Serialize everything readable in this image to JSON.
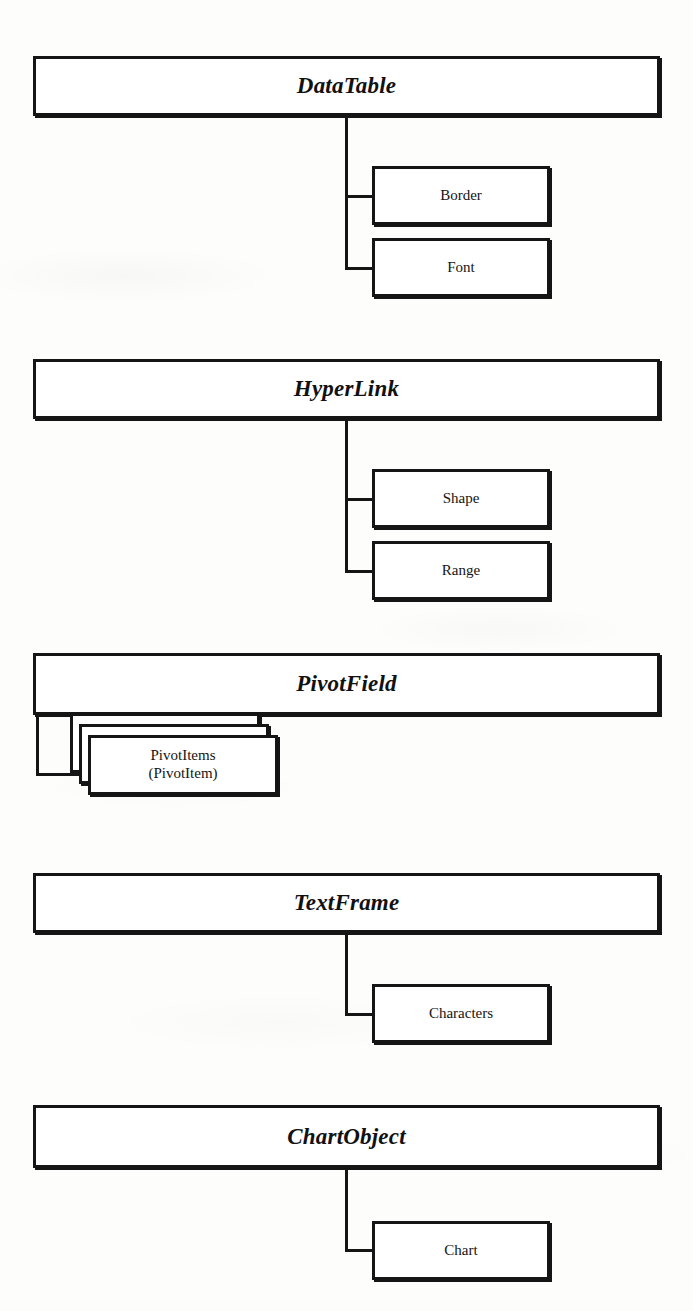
{
  "diagram": {
    "type": "hierarchy",
    "background_color": "#fdfdfb",
    "line_color": "#151515",
    "box_fill_color": "#ffffff",
    "groups": [
      {
        "id": "datatable",
        "parent": "DataTable",
        "parent_box": {
          "x": 33,
          "y": 56,
          "w": 627,
          "h": 60
        },
        "connector": {
          "x": 345,
          "top": 116,
          "bottom": 270
        },
        "children": [
          {
            "label": "Border",
            "collection": false,
            "box": {
              "x": 372,
              "y": 166,
              "w": 178,
              "h": 59
            },
            "stub_y": 195
          },
          {
            "label": "Font",
            "collection": false,
            "box": {
              "x": 372,
              "y": 238,
              "w": 178,
              "h": 59
            },
            "stub_y": 267
          }
        ]
      },
      {
        "id": "hyperlink",
        "parent": "HyperLink",
        "parent_box": {
          "x": 33,
          "y": 359,
          "w": 627,
          "h": 60
        },
        "connector": {
          "x": 345,
          "top": 419,
          "bottom": 572
        },
        "children": [
          {
            "label": "Shape",
            "collection": false,
            "box": {
              "x": 372,
              "y": 469,
              "w": 178,
              "h": 59
            },
            "stub_y": 498
          },
          {
            "label": "Range",
            "collection": false,
            "box": {
              "x": 372,
              "y": 541,
              "w": 178,
              "h": 59
            },
            "stub_y": 570
          }
        ]
      },
      {
        "id": "pivotfield",
        "parent": "PivotField",
        "parent_box": {
          "x": 33,
          "y": 653,
          "w": 627,
          "h": 62
        },
        "connector": {
          "x": 36,
          "top": 715,
          "bottom": 775
        },
        "children": [
          {
            "label": "PivotItems\n(PivotItem)",
            "collection": true,
            "box": {
              "x": 88,
              "y": 735,
              "w": 190,
              "h": 60
            },
            "stub_y": 773,
            "stack_offsets": [
              {
                "dx": -18,
                "dy": -22
              },
              {
                "dx": -9,
                "dy": -11
              }
            ]
          }
        ]
      },
      {
        "id": "textframe",
        "parent": "TextFrame",
        "parent_box": {
          "x": 33,
          "y": 873,
          "w": 627,
          "h": 60
        },
        "connector": {
          "x": 345,
          "top": 933,
          "bottom": 1015
        },
        "children": [
          {
            "label": "Characters",
            "collection": false,
            "box": {
              "x": 372,
              "y": 984,
              "w": 178,
              "h": 59
            },
            "stub_y": 1013
          }
        ]
      },
      {
        "id": "chartobject",
        "parent": "ChartObject",
        "parent_box": {
          "x": 33,
          "y": 1105,
          "w": 627,
          "h": 63
        },
        "connector": {
          "x": 345,
          "top": 1168,
          "bottom": 1251
        },
        "children": [
          {
            "label": "Chart",
            "collection": false,
            "box": {
              "x": 372,
              "y": 1221,
              "w": 178,
              "h": 59
            },
            "stub_y": 1249
          }
        ]
      }
    ]
  }
}
